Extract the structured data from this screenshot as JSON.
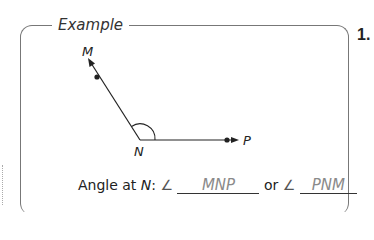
{
  "panel": {
    "title": "Example",
    "problem_number": "1."
  },
  "figure": {
    "points": {
      "M": "M",
      "N": "N",
      "P": "P"
    }
  },
  "question": {
    "prefix": "Angle at ",
    "vertex": "N",
    "colon": ":",
    "angle_symbol": "∠",
    "answer1": "MNP",
    "connector": "or",
    "answer2": "PNM"
  },
  "colors": {
    "stroke": "#222222",
    "frame": "#777777",
    "answer_text": "#8a8a8a"
  }
}
